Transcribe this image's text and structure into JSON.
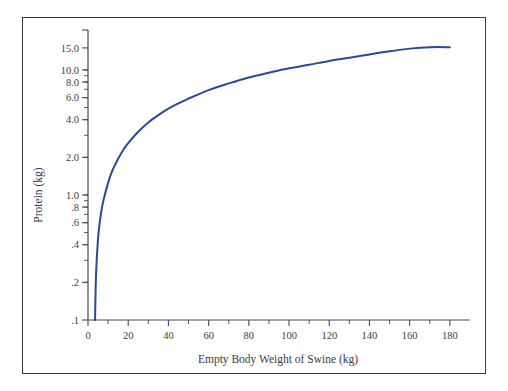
{
  "figure": {
    "background_color": "#ffffff",
    "border_color": "#3a3a3a",
    "axis_color": "#4a4a4a",
    "text_color": "#3c3c3c"
  },
  "chart_data": {
    "type": "line",
    "title": "",
    "subtitle": "",
    "xlabel": "Empty Body Weight of Swine (kg)",
    "ylabel": "Protein (kg)",
    "xlim": [
      0,
      190
    ],
    "ylim": [
      0.1,
      18.0
    ],
    "yscale": "log",
    "xscale": "linear",
    "grid": false,
    "legend": null,
    "legend_position": "none",
    "line_color": "#2a4a96",
    "x_major_ticks": [
      0,
      20,
      40,
      60,
      80,
      100,
      120,
      140,
      160,
      180
    ],
    "x_major_tick_labels": [
      "0",
      "20",
      "40",
      "60",
      "80",
      "100",
      "120",
      "140",
      "160",
      "180"
    ],
    "x_minor_ticks": [
      10,
      30,
      50,
      70,
      90,
      110,
      130,
      150,
      170
    ],
    "y_major_ticks": [
      0.1,
      0.2,
      0.4,
      0.6,
      0.8,
      1.0,
      2.0,
      4.0,
      6.0,
      8.0,
      10.0,
      15.0
    ],
    "y_major_tick_labels": [
      ".1",
      ".2",
      ".4",
      ".6",
      ".8",
      "1.0",
      "2.0",
      "4.0",
      "6.0",
      "8.0",
      "10.0",
      "15.0"
    ],
    "y_minor_ticks": [
      0.3,
      0.5,
      0.7,
      0.9,
      3.0,
      5.0,
      7.0,
      9.0,
      17.0
    ],
    "series": [
      {
        "name": "Body protein mass",
        "x": [
          3.5,
          4,
          5,
          6,
          7,
          8,
          10,
          12,
          15,
          18,
          20,
          25,
          30,
          35,
          40,
          45,
          50,
          60,
          70,
          80,
          90,
          100,
          110,
          120,
          130,
          140,
          150,
          160,
          170,
          180
        ],
        "values": [
          0.1,
          0.23,
          0.45,
          0.63,
          0.8,
          0.95,
          1.25,
          1.55,
          1.95,
          2.35,
          2.6,
          3.2,
          3.8,
          4.35,
          4.9,
          5.4,
          5.9,
          6.9,
          7.8,
          8.7,
          9.5,
          10.3,
          11.0,
          11.8,
          12.5,
          13.3,
          14.1,
          14.8,
          15.2,
          15.2
        ]
      }
    ]
  }
}
